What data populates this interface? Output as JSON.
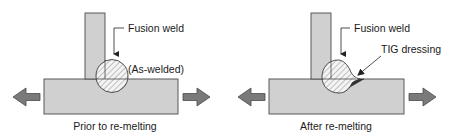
{
  "figure": {
    "panels": [
      {
        "id": "prior",
        "caption": "Prior to re-melting",
        "labels": {
          "fusion_weld": "Fusion weld",
          "state": "(As-welded)"
        }
      },
      {
        "id": "after",
        "caption": "After re-melting",
        "labels": {
          "fusion_weld": "Fusion weld",
          "tig": "TIG dressing"
        }
      }
    ],
    "colors": {
      "plate_fill": "#d0d0d0",
      "outline": "#4a4a4a",
      "arrow_fill": "#7a7a7a",
      "tig_fill": "#2e2e2e",
      "hatch": "#8a8a8a",
      "text": "#1a1a1a"
    },
    "icons": {
      "load_arrow_left": "arrow-left-icon",
      "load_arrow_right": "arrow-right-icon"
    }
  }
}
